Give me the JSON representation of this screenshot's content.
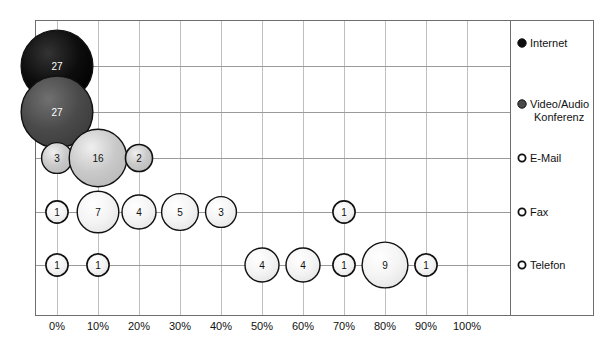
{
  "chart_data": {
    "type": "scatter",
    "title": "",
    "xlabel": "",
    "ylabel": "",
    "xlim": [
      0,
      100
    ],
    "grid": true,
    "legend_position": "right",
    "tick_labels": [
      "0%",
      "10%",
      "20%",
      "30%",
      "40%",
      "50%",
      "60%",
      "70%",
      "80%",
      "90%",
      "100%"
    ],
    "tick_values": [
      0,
      10,
      20,
      30,
      40,
      50,
      60,
      70,
      80,
      90,
      100
    ],
    "categories": [
      "Internet",
      "Video/Audio Konferenz",
      "E-Mail",
      "Fax",
      "Telefon"
    ],
    "series": [
      {
        "name": "Internet",
        "marker": "filled-black",
        "color": "#0d0d0d",
        "text_color": "#ffffff",
        "points": [
          {
            "x": 0,
            "value": 27
          }
        ]
      },
      {
        "name": "Video/Audio Konferenz",
        "marker": "filled-darkgray",
        "color": "#4a4a4a",
        "text_color": "#ffffff",
        "points": [
          {
            "x": 0,
            "value": 27
          }
        ]
      },
      {
        "name": "E-Mail",
        "marker": "open-lightgray",
        "color": "#c9c9c9",
        "text_color": "#111111",
        "points": [
          {
            "x": 0,
            "value": 3
          },
          {
            "x": 10,
            "value": 16
          },
          {
            "x": 20,
            "value": 2
          }
        ]
      },
      {
        "name": "Fax",
        "marker": "open-white",
        "color": "#f4f4f4",
        "text_color": "#111111",
        "points": [
          {
            "x": 0,
            "value": 1
          },
          {
            "x": 10,
            "value": 7
          },
          {
            "x": 20,
            "value": 4
          },
          {
            "x": 30,
            "value": 5
          },
          {
            "x": 40,
            "value": 3
          },
          {
            "x": 70,
            "value": 1
          }
        ]
      },
      {
        "name": "Telefon",
        "marker": "open-white",
        "color": "#f4f4f4",
        "text_color": "#111111",
        "points": [
          {
            "x": 0,
            "value": 1
          },
          {
            "x": 10,
            "value": 1
          },
          {
            "x": 50,
            "value": 4
          },
          {
            "x": 60,
            "value": 4
          },
          {
            "x": 70,
            "value": 1
          },
          {
            "x": 80,
            "value": 9
          },
          {
            "x": 90,
            "value": 1
          }
        ]
      }
    ]
  },
  "legend": {
    "items": [
      {
        "label": "Internet",
        "marker": "legend-dot-filled",
        "color": "#0d0d0d"
      },
      {
        "label": "Video/Audio Konferenz",
        "marker": "legend-dot-darkgray",
        "color": "#4a4a4a"
      },
      {
        "label": "E-Mail",
        "marker": "legend-dot-open",
        "color": "#ffffff"
      },
      {
        "label": "Fax",
        "marker": "legend-dot-open",
        "color": "#ffffff"
      },
      {
        "label": "Telefon",
        "marker": "legend-dot-open",
        "color": "#ffffff"
      }
    ]
  },
  "colors": {
    "frame": "#6e6e6e",
    "grid": "#bfbfbf",
    "row_line": "#9a9a9a",
    "background": "#ffffff",
    "text": "#111111"
  }
}
